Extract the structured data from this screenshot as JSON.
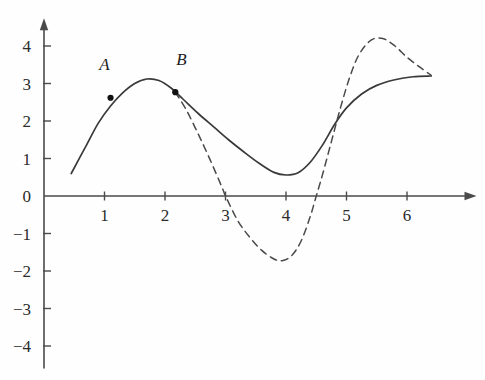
{
  "chart_data": {
    "type": "line",
    "title": "",
    "xlabel": "",
    "ylabel": "",
    "xlim": [
      -0.2,
      7.0
    ],
    "ylim": [
      -4.6,
      4.5
    ],
    "grid": false,
    "legend": "none",
    "x_ticks": [
      "1",
      "2",
      "3",
      "4",
      "5",
      "6"
    ],
    "x_tick_values": [
      1,
      2,
      3,
      4,
      5,
      6
    ],
    "y_ticks": [
      "4",
      "3",
      "2",
      "1",
      "0",
      "−1",
      "−2",
      "−3",
      "−4"
    ],
    "y_tick_values": [
      4,
      3,
      2,
      1,
      0,
      -1,
      -2,
      -3,
      -4
    ],
    "axes": {
      "x_axis_arrow": true,
      "y_axis_arrow": true,
      "origin_label": "0"
    },
    "series": [
      {
        "name": "solid-curve",
        "style": "solid",
        "color": "#3a3a3a",
        "points": [
          [
            0.45,
            0.6
          ],
          [
            0.7,
            1.35
          ],
          [
            0.9,
            1.95
          ],
          [
            1.1,
            2.4
          ],
          [
            1.3,
            2.75
          ],
          [
            1.5,
            3.0
          ],
          [
            1.7,
            3.12
          ],
          [
            1.9,
            3.08
          ],
          [
            2.1,
            2.88
          ],
          [
            2.3,
            2.58
          ],
          [
            2.55,
            2.2
          ],
          [
            2.8,
            1.85
          ],
          [
            3.05,
            1.5
          ],
          [
            3.3,
            1.18
          ],
          [
            3.55,
            0.88
          ],
          [
            3.8,
            0.63
          ],
          [
            4.0,
            0.56
          ],
          [
            4.2,
            0.62
          ],
          [
            4.4,
            0.9
          ],
          [
            4.6,
            1.35
          ],
          [
            4.8,
            1.9
          ],
          [
            5.0,
            2.35
          ],
          [
            5.25,
            2.72
          ],
          [
            5.5,
            2.95
          ],
          [
            5.8,
            3.1
          ],
          [
            6.1,
            3.18
          ],
          [
            6.4,
            3.2
          ]
        ]
      },
      {
        "name": "dashed-curve",
        "style": "dashed",
        "color": "#4a4a4a",
        "points": [
          [
            2.17,
            2.77
          ],
          [
            2.35,
            2.3
          ],
          [
            2.55,
            1.65
          ],
          [
            2.75,
            0.95
          ],
          [
            2.95,
            0.2
          ],
          [
            3.0,
            0.0
          ],
          [
            3.2,
            -0.65
          ],
          [
            3.4,
            -1.1
          ],
          [
            3.6,
            -1.45
          ],
          [
            3.8,
            -1.68
          ],
          [
            3.95,
            -1.72
          ],
          [
            4.1,
            -1.58
          ],
          [
            4.25,
            -1.2
          ],
          [
            4.4,
            -0.55
          ],
          [
            4.5,
            0.0
          ],
          [
            4.6,
            0.55
          ],
          [
            4.75,
            1.45
          ],
          [
            4.9,
            2.35
          ],
          [
            5.05,
            3.15
          ],
          [
            5.2,
            3.75
          ],
          [
            5.4,
            4.15
          ],
          [
            5.6,
            4.2
          ],
          [
            5.8,
            4.0
          ],
          [
            6.0,
            3.7
          ],
          [
            6.2,
            3.45
          ],
          [
            6.4,
            3.22
          ]
        ]
      }
    ],
    "markers": [
      {
        "label": "A",
        "x": 1.1,
        "y": 2.62,
        "label_dx": -0.1,
        "label_dy": 0.75
      },
      {
        "label": "B",
        "x": 2.17,
        "y": 2.77,
        "label_dx": 0.1,
        "label_dy": 0.72
      }
    ]
  }
}
